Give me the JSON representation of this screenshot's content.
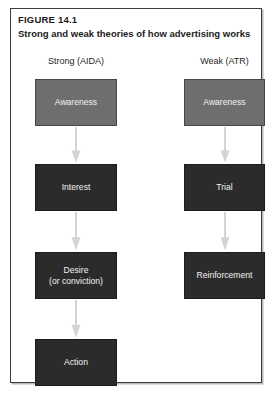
{
  "figure": {
    "number": "FIGURE 14.1",
    "title": "Strong and weak theories of how advertising works"
  },
  "columns": [
    {
      "id": "strong",
      "heading": "Strong (AIDA)",
      "stages": [
        {
          "lines": [
            "Awareness"
          ],
          "tone": "mid",
          "color": "#6e6e6e"
        },
        {
          "lines": [
            "Interest"
          ],
          "tone": "dark",
          "color": "#2b2b2b"
        },
        {
          "lines": [
            "Desire",
            "(or conviction)"
          ],
          "tone": "dark",
          "color": "#2b2b2b"
        },
        {
          "lines": [
            "Action"
          ],
          "tone": "dark",
          "color": "#2b2b2b"
        }
      ],
      "arrows": 3
    },
    {
      "id": "weak",
      "heading": "Weak (ATR)",
      "stages": [
        {
          "lines": [
            "Awareness"
          ],
          "tone": "mid",
          "color": "#6e6e6e"
        },
        {
          "lines": [
            "Trial"
          ],
          "tone": "dark",
          "color": "#2b2b2b"
        },
        {
          "lines": [
            "Reinforcement"
          ],
          "tone": "dark",
          "color": "#2b2b2b"
        }
      ],
      "arrows": 2
    }
  ],
  "palette": {
    "frame_border": "#3d3d3d",
    "frame_shadow": "#b8b8b8",
    "arrow": "#d4d4d4",
    "box_text": "#f2f2f2",
    "heading_text": "#1f1f1f",
    "title_text": "#1b1b1b",
    "background": "#ffffff"
  }
}
